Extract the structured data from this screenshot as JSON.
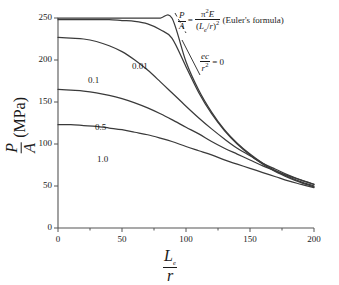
{
  "figure": {
    "background_color": "#ffffff",
    "line_color": "#3a3a3a",
    "axis_color": "#555555"
  },
  "axes": {
    "x": {
      "label_numerator": "L",
      "label_numerator_sub": "e",
      "label_denominator": "r",
      "ticks": [
        "0",
        "50",
        "100",
        "150",
        "200"
      ],
      "min": 0,
      "max": 200
    },
    "y": {
      "label_numerator": "P",
      "label_denominator": "A",
      "label_units": "(MPa)",
      "ticks": [
        "0",
        "50",
        "100",
        "150",
        "200",
        "250"
      ],
      "min": 0,
      "max": 250
    }
  },
  "annotations": {
    "euler": {
      "lhs_num": "P",
      "lhs_den": "A",
      "equals": "=",
      "rhs_num_pi": "π",
      "rhs_num_exp": "2",
      "rhs_num_E": "E",
      "rhs_den_open": "(",
      "rhs_den_L": "L",
      "rhs_den_sub": "e",
      "rhs_den_slash": "/",
      "rhs_den_r": "r",
      "rhs_den_close": ")",
      "rhs_den_exp": "2",
      "caption": "(Euler's formula)"
    },
    "eccentricity_zero": {
      "num": "ec",
      "den": "r",
      "den_exp": "2",
      "equals_value": "= 0"
    }
  },
  "curve_labels": [
    {
      "text": "0.01",
      "x": 132,
      "y": 62
    },
    {
      "text": "0.1",
      "x": 88,
      "y": 76
    },
    {
      "text": "0.5",
      "x": 95,
      "y": 123
    },
    {
      "text": "1.0",
      "x": 97,
      "y": 155
    }
  ],
  "chart_data": {
    "type": "line",
    "title": "",
    "xlabel": "L_e/r",
    "ylabel": "P/A (MPa)",
    "xlim": [
      0,
      200
    ],
    "ylim": [
      0,
      250
    ],
    "grid": false,
    "legend_position": "inline-curve-labels",
    "xticks": [
      0,
      50,
      100,
      150,
      200
    ],
    "yticks": [
      0,
      50,
      100,
      150,
      200,
      250
    ],
    "annotations": [
      "P/A = π²E/(L_e/r)² (Euler's formula)",
      "ec/r² = 0"
    ],
    "x": [
      0,
      10,
      20,
      30,
      40,
      50,
      60,
      70,
      80,
      89,
      100,
      110,
      120,
      130,
      140,
      150,
      160,
      170,
      180,
      190,
      200
    ],
    "series": [
      {
        "name": "ec/r^2 = 0",
        "label": "ec/r² = 0",
        "values": [
          250,
          250,
          250,
          250,
          250,
          250,
          250,
          250,
          250,
          250,
          198,
          164,
          138,
          117,
          101,
          88,
          77,
          68,
          61,
          55,
          50
        ]
      },
      {
        "name": "0.01",
        "label": "0.01",
        "values": [
          248,
          248,
          248,
          248,
          248,
          247,
          246,
          243,
          236,
          226,
          192,
          161,
          136,
          116,
          100,
          87,
          76,
          67,
          60,
          54,
          49
        ]
      },
      {
        "name": "0.1",
        "label": "0.1",
        "values": [
          227,
          226,
          225,
          222,
          217,
          210,
          200,
          188,
          174,
          161,
          145,
          131,
          118,
          106,
          95,
          86,
          77,
          70,
          63,
          57,
          52
        ]
      },
      {
        "name": "0.5",
        "label": "0.5",
        "values": [
          165,
          164,
          163,
          161,
          158,
          154,
          149,
          143,
          136,
          129,
          120,
          112,
          103,
          95,
          88,
          81,
          74,
          68,
          62,
          57,
          52
        ]
      },
      {
        "name": "1.0",
        "label": "1.0",
        "values": [
          123,
          123,
          122,
          121,
          119,
          117,
          114,
          111,
          107,
          103,
          97,
          92,
          87,
          81,
          76,
          71,
          66,
          61,
          56,
          52,
          48
        ]
      }
    ]
  }
}
